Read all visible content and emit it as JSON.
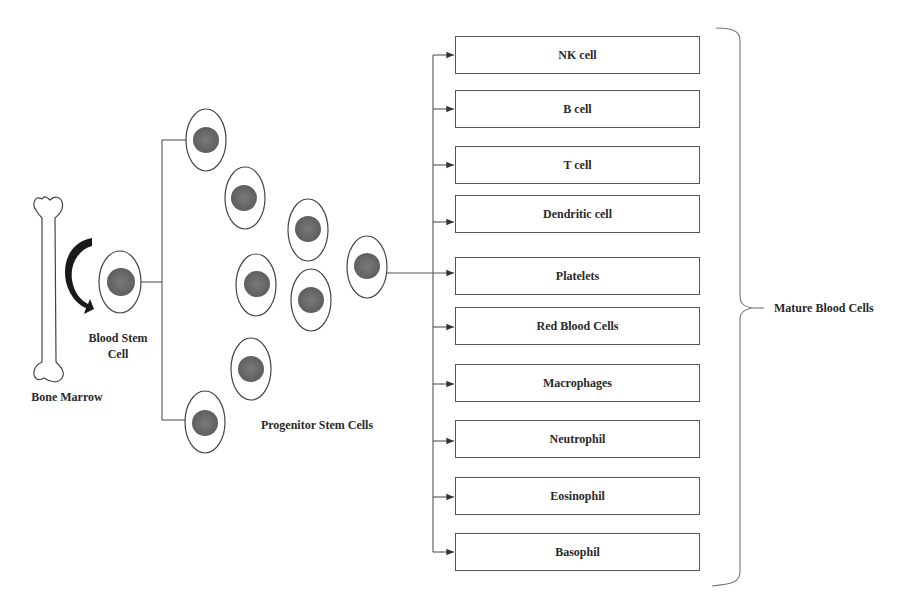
{
  "diagram": {
    "type": "hematopoiesis-flow",
    "labels": {
      "bone_marrow": "Bone Marrow",
      "blood_stem_cell_line1": "Blood Stem",
      "blood_stem_cell_line2": "Cell",
      "progenitor": "Progenitor Stem Cells",
      "mature": "Mature Blood Cells"
    },
    "progenitor_cell_count": 8,
    "mature_cells": [
      {
        "label": "NK cell",
        "top": 36
      },
      {
        "label": "B cell",
        "top": 90
      },
      {
        "label": "T cell",
        "top": 146
      },
      {
        "label": "Dendritic cell",
        "top": 195
      },
      {
        "label": "Platelets",
        "top": 257
      },
      {
        "label": "Red Blood Cells",
        "top": 307
      },
      {
        "label": "Macrophages",
        "top": 364
      },
      {
        "label": "Neutrophil",
        "top": 420
      },
      {
        "label": "Eosinophil",
        "top": 477
      },
      {
        "label": "Basophil",
        "top": 533
      }
    ],
    "colors": {
      "nucleus": "#6e6e6e",
      "outline": "#444444",
      "line": "#555555",
      "arrow_fill": "#1a1a1a"
    }
  }
}
